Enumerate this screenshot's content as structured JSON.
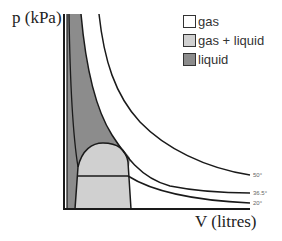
{
  "axes": {
    "y_label": "p (kPa)",
    "x_label": "V (litres)"
  },
  "legend": {
    "items": [
      {
        "label": "gas",
        "color": "#ffffff"
      },
      {
        "label": "gas + liquid",
        "color": "#d0d0d0"
      },
      {
        "label": "liquid",
        "color": "#8c8c8c"
      }
    ]
  },
  "isotherms": [
    {
      "label": "50°"
    },
    {
      "label": "36.5°"
    },
    {
      "label": "20°"
    }
  ],
  "colors": {
    "liquid": "#8c8c8c",
    "gas_liquid": "#d0d0d0",
    "gas": "#ffffff",
    "line": "#1a1a1a"
  }
}
